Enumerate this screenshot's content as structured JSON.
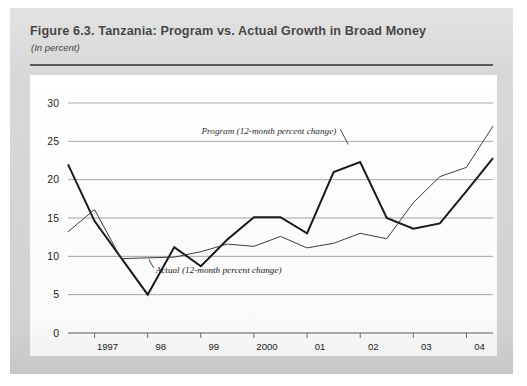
{
  "figure": {
    "title": "Figure 6.3. Tanzania: Program vs.  Actual Growth in Broad Money",
    "subtitle": "(In percent)"
  },
  "chart_data": {
    "type": "line",
    "title": "Figure 6.3. Tanzania: Program vs.  Actual Growth in Broad Money",
    "subtitle": "(In percent)",
    "xlabel": "",
    "ylabel": "",
    "unit": "percent",
    "ylim": [
      0,
      30
    ],
    "ytick_values": [
      0,
      5,
      10,
      15,
      20,
      25,
      30
    ],
    "ytick_labels": [
      "0",
      "5",
      "10",
      "15",
      "20",
      "25",
      "30"
    ],
    "grid": "horizontal",
    "legend": "inline-annotations",
    "xtick_labels": [
      "1997",
      "98",
      "99",
      "2000",
      "01",
      "02",
      "03",
      "04"
    ],
    "xtick_positions": [
      1,
      3,
      5,
      7,
      9,
      11,
      13,
      15
    ],
    "x_index_range": [
      0,
      16
    ],
    "series": [
      {
        "name": "Actual (12-month percent change)",
        "style": "thick-dark",
        "annotation": "Actual (12-month percent change)",
        "x": [
          0,
          1,
          2,
          3,
          4,
          5,
          6,
          7,
          8,
          9,
          10,
          11,
          12,
          13,
          14,
          15,
          16
        ],
        "values": [
          22.0,
          14.6,
          9.8,
          5.0,
          11.2,
          8.7,
          12.2,
          15.1,
          15.1,
          13.0,
          21.0,
          22.3,
          15.0,
          13.6,
          14.3,
          18.5,
          22.8
        ]
      },
      {
        "name": "Program (12-month percent change)",
        "style": "thin-dark",
        "annotation": "Program (12-month percent change)",
        "x": [
          0,
          1,
          2,
          3,
          4,
          5,
          6,
          7,
          8,
          9,
          10,
          11,
          12,
          13,
          14,
          15,
          16
        ],
        "values": [
          13.2,
          16.1,
          9.7,
          9.8,
          9.9,
          10.6,
          11.6,
          11.3,
          12.6,
          11.1,
          11.7,
          13.0,
          12.3,
          17.0,
          20.4,
          21.6,
          27.0
        ]
      }
    ],
    "annotations": [
      {
        "text": "Program (12-month percent change)",
        "series": "Program (12-month percent change)",
        "anchor_x": 10.1,
        "anchor_y": 26.0
      },
      {
        "text": "Actual (12-month percent change)",
        "series": "Actual (12-month percent change)",
        "anchor_x": 3.3,
        "anchor_y": 7.8
      }
    ],
    "colors": {
      "actual_line": "#151515",
      "program_line": "#3a3a3a",
      "gridline": "#9a9a9a",
      "panel_background": "#ffffff",
      "figure_background": "#d6d6d6"
    }
  }
}
